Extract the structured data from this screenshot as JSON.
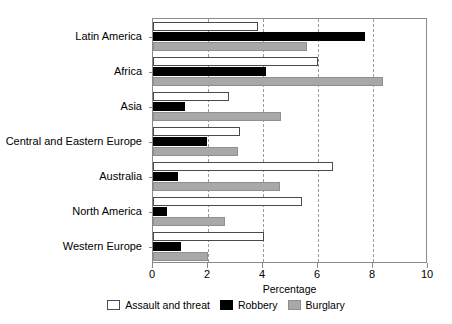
{
  "chart_data": {
    "type": "bar",
    "orientation": "horizontal",
    "title": "",
    "subtitle": "",
    "xlabel": "Percentage",
    "ylabel": "",
    "xlim": [
      0,
      10
    ],
    "xticks": [
      0,
      2,
      4,
      6,
      8,
      10
    ],
    "xtick_labels": [
      "0",
      "2",
      "4",
      "6",
      "8",
      "10"
    ],
    "grid": "vertical-dashed",
    "legend_position": "bottom-center",
    "categories": [
      "Latin America",
      "Africa",
      "Asia",
      "Central and Eastern Europe",
      "Australia",
      "North America",
      "Western Europe"
    ],
    "series": [
      {
        "name": "Assault and threat",
        "color": "#ffffff",
        "edge_color": "#4a4a4a",
        "values": [
          3.8,
          6.0,
          2.75,
          3.15,
          6.55,
          5.4,
          4.05
        ]
      },
      {
        "name": "Robbery",
        "color": "#000000",
        "edge_color": "#000000",
        "values": [
          7.7,
          4.1,
          1.15,
          1.95,
          0.9,
          0.5,
          1.0
        ]
      },
      {
        "name": "Burglary",
        "color": "#a8a8a8",
        "edge_color": "#8f8f8f",
        "values": [
          5.6,
          8.35,
          4.65,
          3.1,
          4.6,
          2.6,
          2.0
        ]
      }
    ]
  },
  "axis": {
    "x_title": "Percentage"
  },
  "legend": {
    "items": [
      {
        "label": "Assault and threat"
      },
      {
        "label": "Robbery"
      },
      {
        "label": "Burglary"
      }
    ]
  }
}
